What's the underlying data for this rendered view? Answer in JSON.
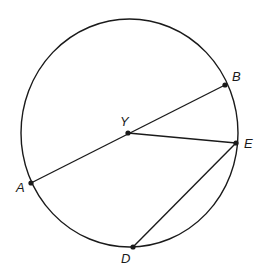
{
  "diagram": {
    "type": "circle-geometry",
    "colors": {
      "stroke": "#1a1a1a",
      "background": "#ffffff"
    },
    "circle": {
      "cx": 129.5,
      "cy": 133,
      "rx": 108.5,
      "ry": 114
    },
    "points": {
      "Y": {
        "label": "Y",
        "x": 128,
        "y": 133,
        "lx": 120,
        "ly": 126
      },
      "B": {
        "label": "B",
        "x": 225,
        "y": 85,
        "lx": 232,
        "ly": 81
      },
      "E": {
        "label": "E",
        "x": 236,
        "y": 143,
        "lx": 244,
        "ly": 148
      },
      "A": {
        "label": "A",
        "x": 31,
        "y": 183,
        "lx": 16,
        "ly": 192
      },
      "D": {
        "label": "D",
        "x": 133,
        "y": 247,
        "lx": 121,
        "ly": 263
      }
    },
    "segments": [
      {
        "name": "AB",
        "from": "A",
        "to": "B"
      },
      {
        "name": "YE",
        "from": "Y",
        "to": "E"
      },
      {
        "name": "ED",
        "from": "E",
        "to": "D"
      }
    ]
  }
}
